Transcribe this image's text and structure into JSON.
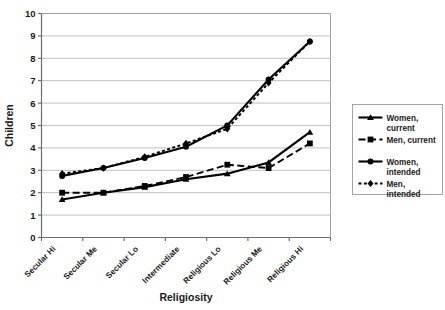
{
  "chart_data": {
    "type": "line",
    "title": "",
    "xlabel": "Religiosity",
    "ylabel": "Children",
    "categories": [
      "Secular Hi",
      "Secular Me",
      "Secular Lo",
      "Intermediate",
      "Religious Lo",
      "Religious Me",
      "Religious Hi"
    ],
    "ylim": [
      0,
      10
    ],
    "ytick_labels": [
      "0",
      "1",
      "2",
      "3",
      "4",
      "5",
      "6",
      "7",
      "8",
      "9",
      "10"
    ],
    "yticks": [
      0,
      1,
      2,
      3,
      4,
      5,
      6,
      7,
      8,
      9,
      10
    ],
    "grid": true,
    "legend_position": "right",
    "series": [
      {
        "name": "Women, current",
        "label_line1": "Women,",
        "label_line2": "current",
        "marker": "triangle",
        "dash": "solid",
        "color": "#000000",
        "values": [
          1.7,
          2.0,
          2.25,
          2.6,
          2.85,
          3.35,
          4.7
        ]
      },
      {
        "name": "Men, current",
        "label_line1": "Men, current",
        "label_line2": "",
        "marker": "square",
        "dash": "dashed",
        "color": "#000000",
        "values": [
          2.0,
          2.0,
          2.3,
          2.7,
          3.25,
          3.1,
          4.2
        ]
      },
      {
        "name": "Women, intended",
        "label_line1": "Women,",
        "label_line2": "intended",
        "marker": "circle",
        "dash": "solid",
        "color": "#000000",
        "values": [
          2.75,
          3.1,
          3.55,
          4.05,
          5.0,
          7.05,
          8.75
        ]
      },
      {
        "name": "Men, intended",
        "label_line1": "Men,",
        "label_line2": "intended",
        "marker": "diamond",
        "dash": "dotted",
        "color": "#000000",
        "values": [
          2.85,
          3.1,
          3.6,
          4.2,
          4.85,
          6.9,
          8.75
        ]
      }
    ]
  }
}
